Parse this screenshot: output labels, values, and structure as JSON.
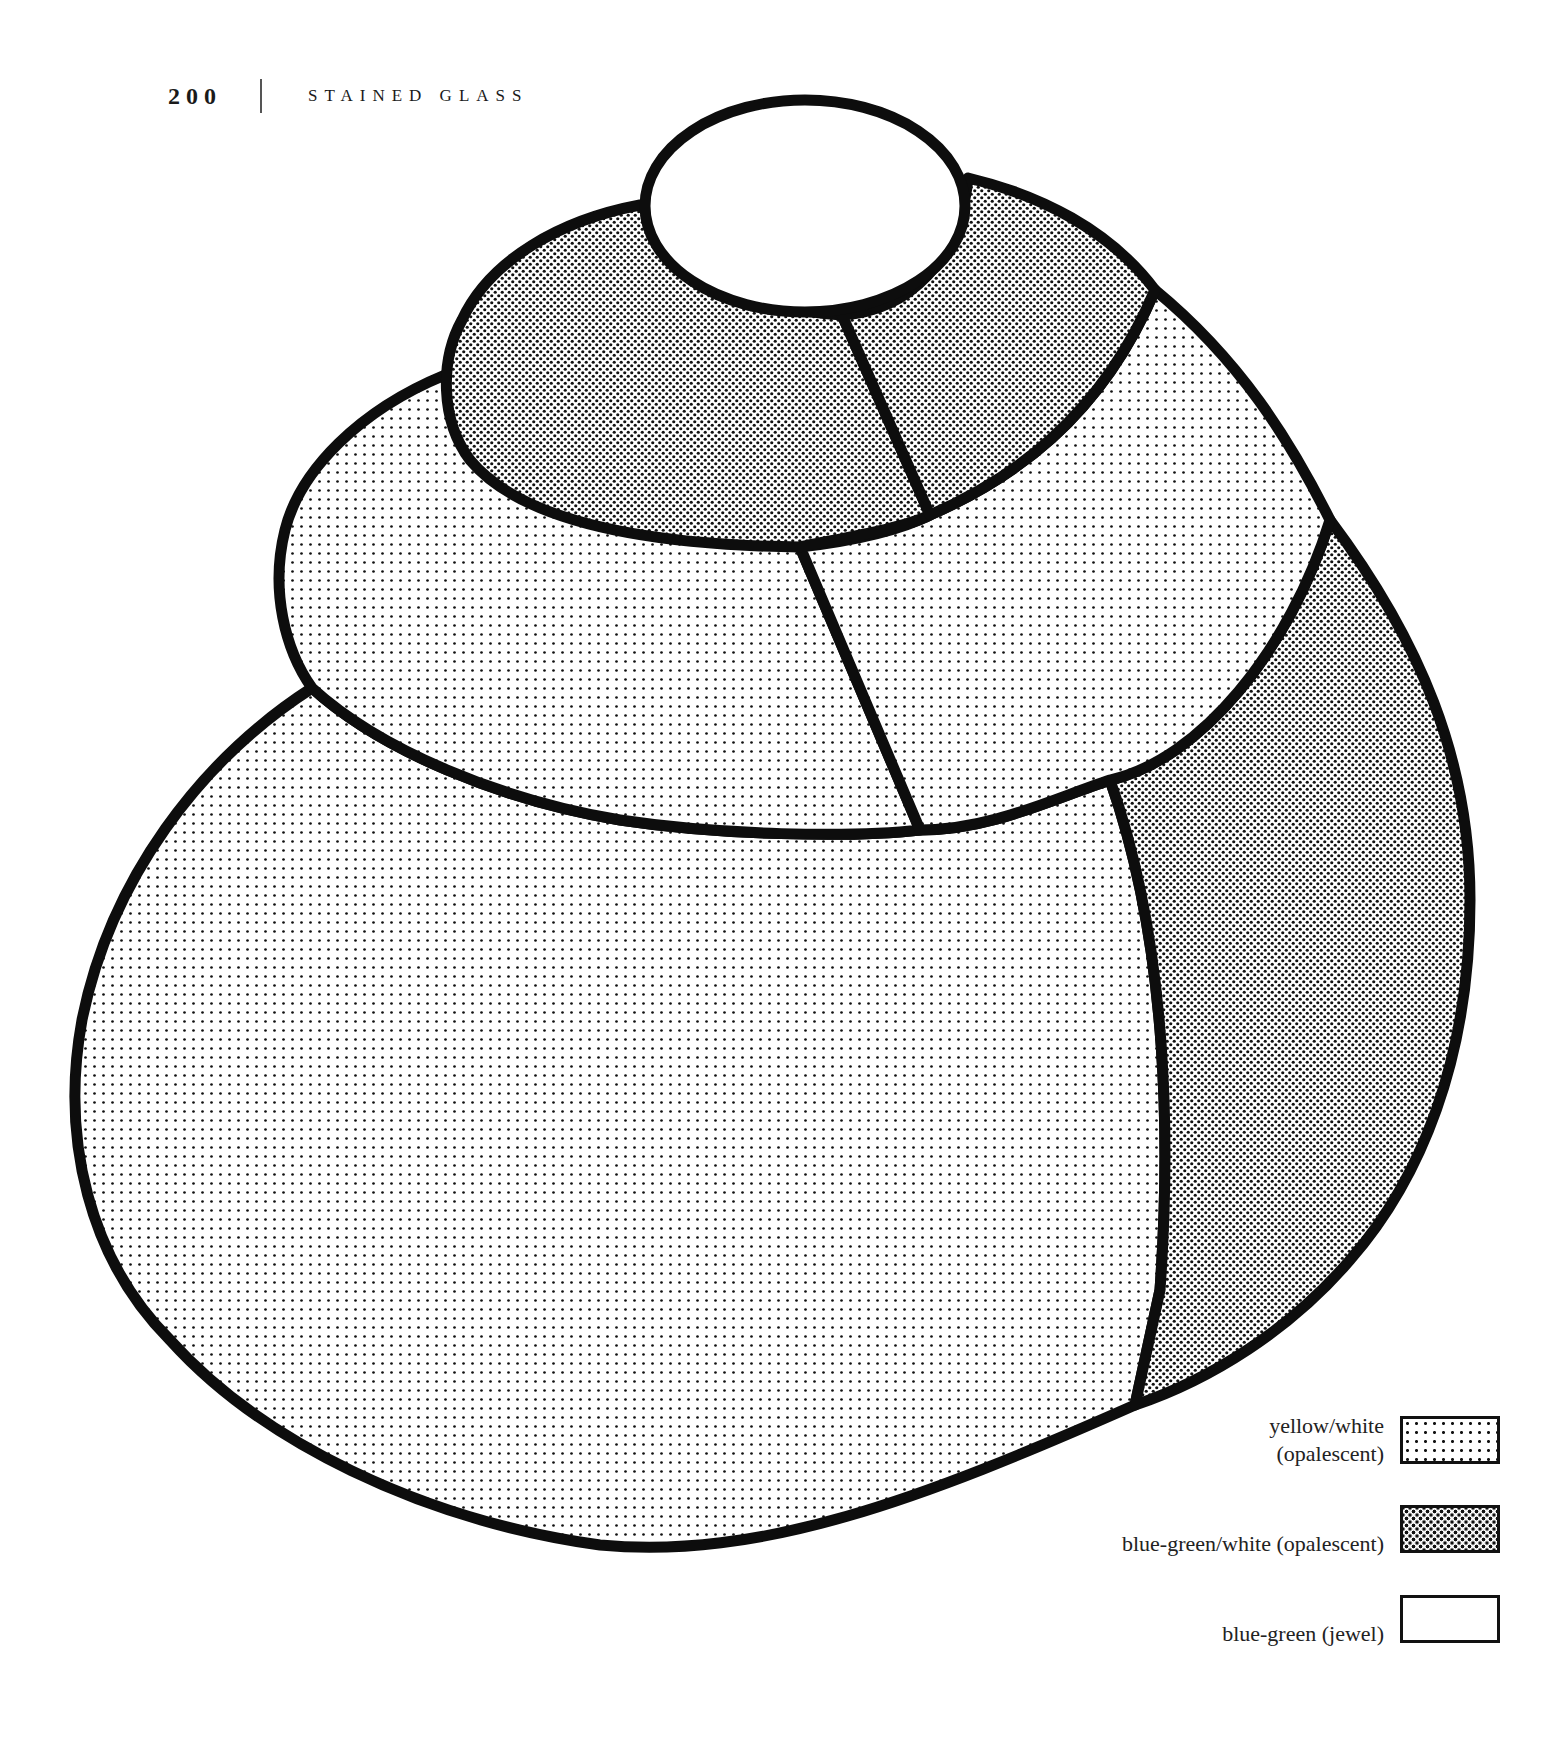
{
  "header": {
    "page_number": "200",
    "section_title": "STAINED GLASS"
  },
  "pattern": {
    "description": "Stained glass pattern of stacked rounded shapes (three tiers) topped with a small oval",
    "pieces": [
      {
        "id": "top-oval",
        "glass": "blue-green (jewel)"
      },
      {
        "id": "second-tier-left",
        "glass": "blue-green/white (opalescent)"
      },
      {
        "id": "second-tier-right",
        "glass": "blue-green/white (opalescent)"
      },
      {
        "id": "third-tier-left",
        "glass": "yellow/white (opalescent)"
      },
      {
        "id": "third-tier-right",
        "glass": "yellow/white (opalescent)"
      },
      {
        "id": "right-side-band",
        "glass": "blue-green/white (opalescent)"
      },
      {
        "id": "bottom-body",
        "glass": "yellow/white (opalescent)"
      }
    ]
  },
  "legend": {
    "items": [
      {
        "label_line1": "yellow/white",
        "label_line2": "(opalescent)",
        "swatch": "light-dots"
      },
      {
        "label_line1": "blue-green/white (opalescent)",
        "label_line2": "",
        "swatch": "dense-dots"
      },
      {
        "label_line1": "blue-green (jewel)",
        "label_line2": "",
        "swatch": "plain"
      }
    ]
  },
  "colors": {
    "lead_line": "#0d0d0d",
    "paper": "#ffffff"
  }
}
